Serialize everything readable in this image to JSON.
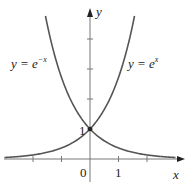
{
  "chart_data": {
    "type": "line",
    "title": "",
    "xlabel": "x",
    "ylabel": "y",
    "xlim": [
      -3.1,
      3.2
    ],
    "ylim": [
      -0.8,
      5.0
    ],
    "x_ticks": [
      -2,
      -1,
      0,
      1,
      2
    ],
    "x_tick_labels": [
      "0",
      "1"
    ],
    "y_ticks": [
      1,
      2,
      3,
      4
    ],
    "y_tick_labels": [
      "1"
    ],
    "grid": false,
    "legend": "inline labels",
    "series": [
      {
        "name": "y = e^x",
        "function": "exp(x)",
        "x": [
          -3,
          -2,
          -1,
          0,
          1,
          1.5
        ],
        "values": [
          0.05,
          0.14,
          0.37,
          1,
          2.72,
          4.48
        ]
      },
      {
        "name": "y = e^-x",
        "function": "exp(-x)",
        "x": [
          -1.5,
          -1,
          0,
          1,
          2,
          3
        ],
        "values": [
          4.48,
          2.72,
          1,
          0.37,
          0.14,
          0.05
        ]
      }
    ],
    "annotations": [
      {
        "text": "1",
        "at": [
          0,
          1
        ],
        "note": "intersection point (0, 1)"
      }
    ]
  },
  "labels": {
    "x_axis": "x",
    "y_axis": "y",
    "origin": "0",
    "x_one": "1",
    "y_one": "1",
    "eq_left_base": "y = e",
    "eq_left_exp": "−x",
    "eq_right_base": "y = e",
    "eq_right_exp": "x"
  },
  "colors": {
    "curve": "#555555",
    "axis": "#777777",
    "text": "#222222",
    "point": "#222222"
  }
}
